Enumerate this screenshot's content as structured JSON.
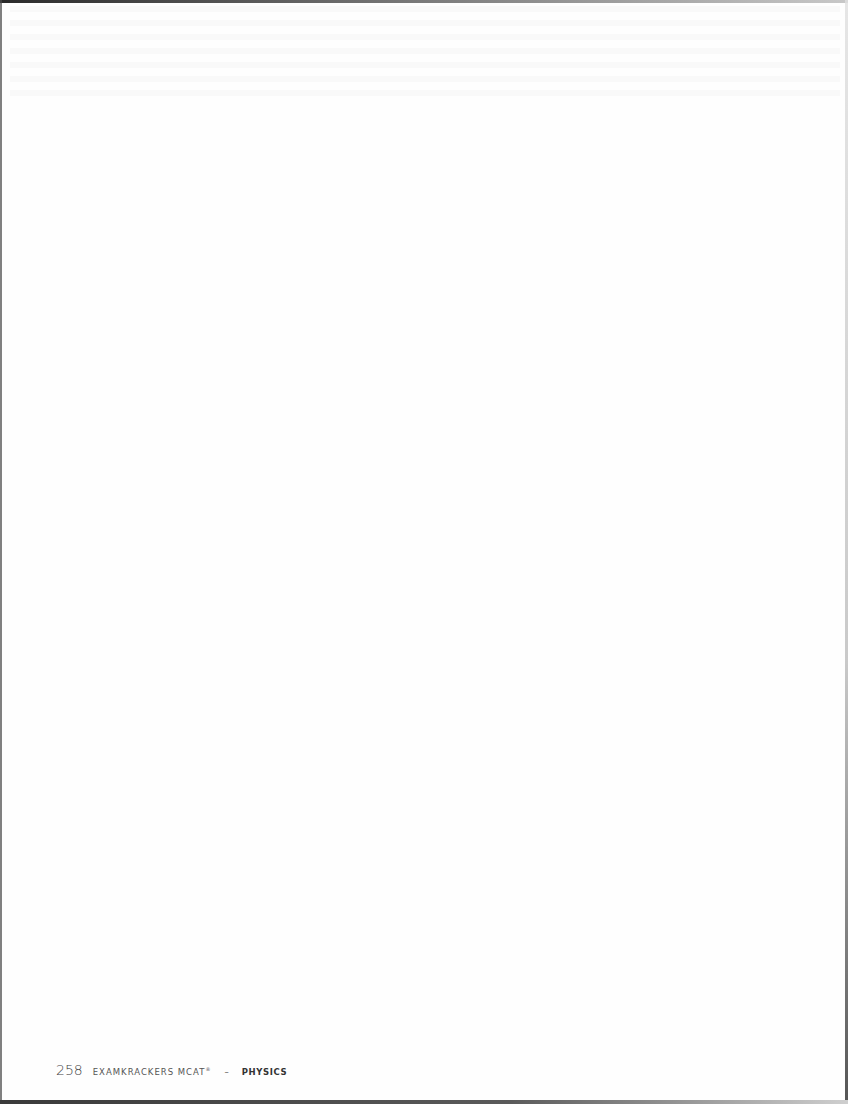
{
  "page": {
    "content": "",
    "footer": {
      "page_number": "258",
      "book_title": "EXAMKRACKERS MCAT",
      "trademark": "®",
      "separator": "–",
      "subject": "PHYSICS"
    }
  }
}
